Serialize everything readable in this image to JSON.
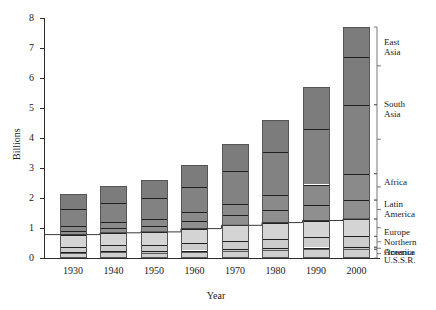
{
  "chart_data": {
    "type": "bar",
    "stacked": true,
    "title": "",
    "xlabel": "Year",
    "ylabel": "Billions",
    "ylim": [
      0,
      8
    ],
    "yticks": [
      0,
      1,
      2,
      3,
      4,
      5,
      6,
      7,
      8
    ],
    "ytick_labels": [
      "0",
      "1",
      "2",
      "3",
      "4",
      "5",
      "6",
      "7",
      "8"
    ],
    "categories": [
      "1930",
      "1940",
      "1950",
      "1960",
      "1970",
      "1980",
      "1990",
      "2000"
    ],
    "grid": false,
    "legend_position": "right-of-plot",
    "series": [
      {
        "name": "U.S.S.R.",
        "color": "#cfcfcf",
        "values": [
          0.18,
          0.2,
          0.18,
          0.21,
          0.24,
          0.27,
          0.29,
          0.29
        ]
      },
      {
        "name": "Oceania",
        "color": "#c4c4c4",
        "values": [
          0.03,
          0.03,
          0.04,
          0.04,
          0.05,
          0.06,
          0.06,
          0.07
        ]
      },
      {
        "name": "Northern America",
        "color": "#cccccc",
        "values": [
          0.17,
          0.19,
          0.22,
          0.26,
          0.29,
          0.31,
          0.34,
          0.36
        ]
      },
      {
        "name": "Europe",
        "color": "#d4d4d4",
        "values": [
          0.4,
          0.42,
          0.43,
          0.47,
          0.51,
          0.54,
          0.56,
          0.58
        ]
      },
      {
        "name": "Latin America",
        "color": "#8f8f8f",
        "values": [
          0.13,
          0.16,
          0.19,
          0.25,
          0.33,
          0.42,
          0.52,
          0.63
        ]
      },
      {
        "name": "Africa",
        "color": "#8a8a8a",
        "values": [
          0.16,
          0.2,
          0.24,
          0.3,
          0.39,
          0.51,
          0.68,
          0.88
        ]
      },
      {
        "name": "South Asia",
        "color": "#828282",
        "values": [
          0.55,
          0.62,
          0.7,
          0.84,
          1.08,
          1.42,
          1.86,
          2.3
        ]
      },
      {
        "name": "East Asia",
        "color": "#7c7c7c",
        "values": [
          0.52,
          0.58,
          0.6,
          0.73,
          0.91,
          1.07,
          1.39,
          1.6
        ]
      }
    ],
    "totals": [
      2.14,
      2.4,
      2.6,
      3.1,
      3.8,
      4.6,
      5.7,
      6.71
    ],
    "bar_tops": [
      2.14,
      2.4,
      2.6,
      3.1,
      3.8,
      4.6,
      5.7,
      7.7
    ],
    "annotations": {
      "step_line": "connecting line across tops of Europe segment"
    }
  },
  "legend": {
    "entries": [
      {
        "label": "East\nAsia"
      },
      {
        "label": "South\nAsia"
      },
      {
        "label": "Africa"
      },
      {
        "label": "Latin\nAmerica"
      },
      {
        "label": "Europe"
      },
      {
        "label": "Northern\nAmerica"
      },
      {
        "label": "Oceania"
      },
      {
        "label": "U.S.S.R."
      }
    ]
  },
  "colors": {
    "axis": "#2b2b2b",
    "dark_segment": "#808080",
    "light_segment": "#cfcfcf",
    "background": "#ffffff",
    "divider": "#1f1f1f"
  }
}
